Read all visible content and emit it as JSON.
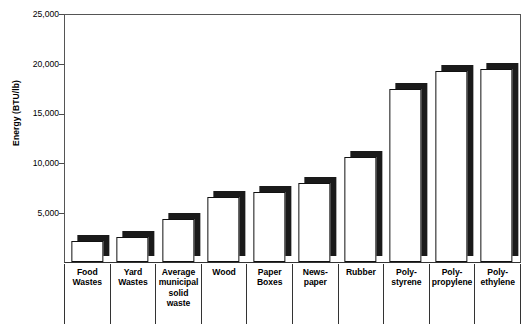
{
  "chart_data": {
    "type": "bar",
    "title": "",
    "xlabel": "",
    "ylabel": "Energy (BTU/lb)",
    "ylim": [
      0,
      25000
    ],
    "ytick_labels": [
      "25,000",
      "20,000",
      "15,000",
      "10,000",
      "5,000"
    ],
    "ytick_values": [
      25000,
      20000,
      15000,
      10000,
      5000
    ],
    "grid": false,
    "legend": "none",
    "bar_style": "3d-white-front-black-shadow",
    "categories": [
      "Food Wastes",
      "Yard Wastes",
      "Average municipal solid waste",
      "Wood",
      "Paper Boxes",
      "News-paper",
      "Rubber",
      "Poly-styrene",
      "Poly-propylene",
      "Poly-ethylene"
    ],
    "category_label_lines": [
      [
        "Food",
        "Wastes"
      ],
      [
        "Yard",
        "Wastes"
      ],
      [
        "Average",
        "municipal",
        "solid",
        "waste"
      ],
      [
        "Wood"
      ],
      [
        "Paper",
        "Boxes"
      ],
      [
        "News-",
        "paper"
      ],
      [
        "Rubber"
      ],
      [
        "Poly-",
        "styrene"
      ],
      [
        "Poly-",
        "propylene"
      ],
      [
        "Poly-",
        "ethylene"
      ]
    ],
    "values": [
      2100,
      2500,
      4300,
      6500,
      7000,
      7900,
      10500,
      17400,
      19200,
      19400
    ]
  },
  "colors": {
    "bar_face": "#ffffff",
    "bar_outline": "#111111",
    "bar_shadow": "#1a1a1a",
    "axis": "#333333",
    "background": "#ffffff"
  }
}
